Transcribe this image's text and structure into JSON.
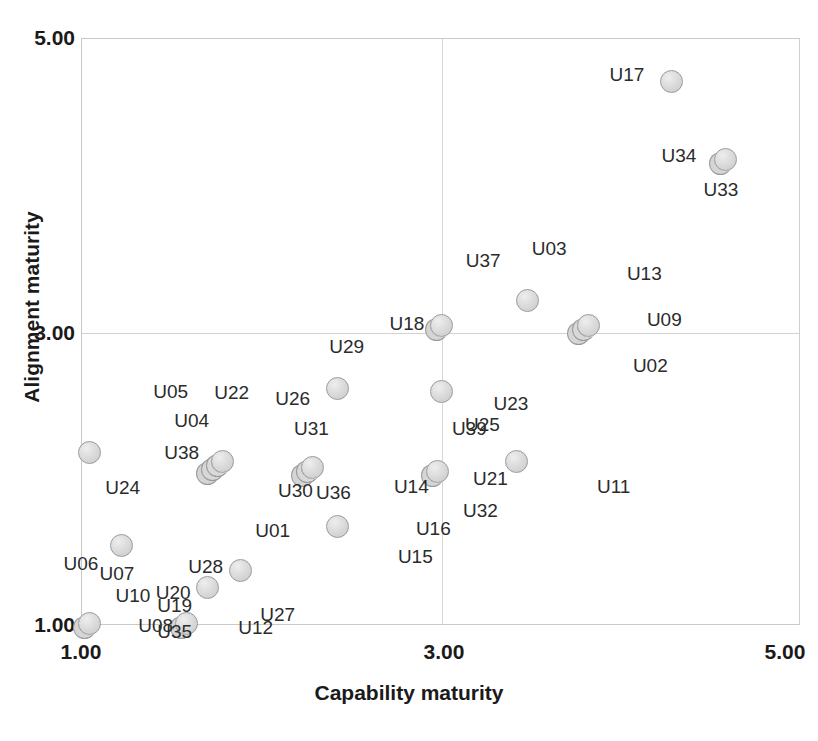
{
  "chart_data": {
    "type": "scatter",
    "title": "",
    "xlabel": "Capability maturity",
    "ylabel": "Alignment maturity",
    "xlim": [
      1.0,
      5.0
    ],
    "ylim": [
      1.0,
      5.0
    ],
    "xticks": [
      "1.00",
      "3.00",
      "5.00"
    ],
    "yticks": [
      "1.00",
      "3.00",
      "5.00"
    ],
    "xtick_values": [
      1.0,
      3.0,
      5.0
    ],
    "ytick_values": [
      1.0,
      3.0,
      5.0
    ],
    "grid": true,
    "gridlines_x": [
      3.0
    ],
    "gridlines_y": [
      3.0
    ],
    "legend": "none",
    "marker_color": "#dcdcdc",
    "marker_edge_color": "#9a9a9a",
    "points": [
      {
        "label": "U17",
        "x": 4.28,
        "y": 4.71,
        "label_dx": -62,
        "label_dy": -8
      },
      {
        "label": "U34",
        "x": 4.58,
        "y": 4.18,
        "label_dx": -64,
        "label_dy": -4
      },
      {
        "label": "U33",
        "x": 4.58,
        "y": 4.18,
        "label_dx": -22,
        "label_dy": 30
      },
      {
        "label": "U37",
        "x": 3.48,
        "y": 3.22,
        "label_dx": -62,
        "label_dy": -40
      },
      {
        "label": "U03",
        "x": 3.48,
        "y": 3.22,
        "label_dx": 4,
        "label_dy": -52
      },
      {
        "label": "U13",
        "x": 3.82,
        "y": 3.05,
        "label_dx": 38,
        "label_dy": -52
      },
      {
        "label": "U09",
        "x": 3.82,
        "y": 3.05,
        "label_dx": 58,
        "label_dy": -6
      },
      {
        "label": "U02",
        "x": 3.82,
        "y": 3.05,
        "label_dx": 44,
        "label_dy": 40
      },
      {
        "label": "U18",
        "x": 3.0,
        "y": 3.05,
        "label_dx": -52,
        "label_dy": -2
      },
      {
        "label": "U29",
        "x": 2.42,
        "y": 2.62,
        "label_dx": -8,
        "label_dy": -42
      },
      {
        "label": "U26",
        "x": 2.42,
        "y": 2.62,
        "label_dx": -62,
        "label_dy": 10
      },
      {
        "label": "U23",
        "x": 3.0,
        "y": 2.6,
        "label_dx": 52,
        "label_dy": 12
      },
      {
        "label": "U05",
        "x": 1.04,
        "y": 2.18,
        "label_dx": 64,
        "label_dy": -62
      },
      {
        "label": "U24",
        "x": 1.04,
        "y": 2.18,
        "label_dx": 16,
        "label_dy": 34
      },
      {
        "label": "U22",
        "x": 1.78,
        "y": 2.12,
        "label_dx": -8,
        "label_dy": -70
      },
      {
        "label": "U04",
        "x": 1.78,
        "y": 2.12,
        "label_dx": -48,
        "label_dy": -42
      },
      {
        "label": "U38",
        "x": 1.78,
        "y": 2.12,
        "label_dx": -58,
        "label_dy": -10
      },
      {
        "label": "U31",
        "x": 2.28,
        "y": 2.08,
        "label_dx": -18,
        "label_dy": -40
      },
      {
        "label": "U30",
        "x": 2.28,
        "y": 2.08,
        "label_dx": -34,
        "label_dy": 22
      },
      {
        "label": "U36",
        "x": 2.28,
        "y": 2.08,
        "label_dx": 4,
        "label_dy": 24
      },
      {
        "label": "U39",
        "x": 2.98,
        "y": 2.05,
        "label_dx": 14,
        "label_dy": -44
      },
      {
        "label": "U14",
        "x": 2.98,
        "y": 2.05,
        "label_dx": -44,
        "label_dy": 14
      },
      {
        "label": "U25",
        "x": 3.42,
        "y": 2.12,
        "label_dx": -52,
        "label_dy": -38
      },
      {
        "label": "U21",
        "x": 3.42,
        "y": 2.12,
        "label_dx": -44,
        "label_dy": 16
      },
      {
        "label": "U11",
        "x": 3.42,
        "y": 2.12,
        "label_dx": 80,
        "label_dy": 24
      },
      {
        "label": "U32",
        "x": 3.42,
        "y": 2.12,
        "label_dx": -54,
        "label_dy": 48
      },
      {
        "label": "U16",
        "x": 2.98,
        "y": 2.05,
        "label_dx": -22,
        "label_dy": 56
      },
      {
        "label": "U15",
        "x": 2.98,
        "y": 2.05,
        "label_dx": -40,
        "label_dy": 84
      },
      {
        "label": "U01",
        "x": 2.42,
        "y": 1.68,
        "label_dx": -82,
        "label_dy": 4
      },
      {
        "label": "U06",
        "x": 1.22,
        "y": 1.55,
        "label_dx": -58,
        "label_dy": 18
      },
      {
        "label": "U07",
        "x": 1.22,
        "y": 1.55,
        "label_dx": -22,
        "label_dy": 28
      },
      {
        "label": "U10",
        "x": 1.22,
        "y": 1.55,
        "label_dx": -6,
        "label_dy": 50
      },
      {
        "label": "U28",
        "x": 1.88,
        "y": 1.38,
        "label_dx": -52,
        "label_dy": -4
      },
      {
        "label": "U20",
        "x": 1.7,
        "y": 1.26,
        "label_dx": -52,
        "label_dy": 4
      },
      {
        "label": "U19",
        "x": 1.04,
        "y": 1.02,
        "label_dx": 68,
        "label_dy": -18
      },
      {
        "label": "U35",
        "x": 1.04,
        "y": 1.02,
        "label_dx": 68,
        "label_dy": 8
      },
      {
        "label": "U08",
        "x": 1.58,
        "y": 1.02,
        "label_dx": -48,
        "label_dy": 2
      },
      {
        "label": "U12",
        "x": 1.58,
        "y": 1.02,
        "label_dx": 52,
        "label_dy": 4
      },
      {
        "label": "U27",
        "x": 1.88,
        "y": 1.38,
        "label_dx": 20,
        "label_dy": 44
      }
    ],
    "markers": [
      {
        "x": 4.28,
        "y": 4.71,
        "stack": 1
      },
      {
        "x": 4.58,
        "y": 4.18,
        "stack": 2
      },
      {
        "x": 3.48,
        "y": 3.22,
        "stack": 1
      },
      {
        "x": 3.82,
        "y": 3.05,
        "stack": 3
      },
      {
        "x": 3.0,
        "y": 3.05,
        "stack": 2
      },
      {
        "x": 2.42,
        "y": 2.62,
        "stack": 1
      },
      {
        "x": 3.0,
        "y": 2.6,
        "stack": 1
      },
      {
        "x": 1.04,
        "y": 2.18,
        "stack": 1
      },
      {
        "x": 1.78,
        "y": 2.12,
        "stack": 4
      },
      {
        "x": 2.28,
        "y": 2.08,
        "stack": 3
      },
      {
        "x": 2.98,
        "y": 2.05,
        "stack": 2
      },
      {
        "x": 3.42,
        "y": 2.12,
        "stack": 1
      },
      {
        "x": 2.42,
        "y": 1.68,
        "stack": 1
      },
      {
        "x": 1.22,
        "y": 1.55,
        "stack": 1
      },
      {
        "x": 1.88,
        "y": 1.38,
        "stack": 1
      },
      {
        "x": 1.7,
        "y": 1.26,
        "stack": 1
      },
      {
        "x": 1.04,
        "y": 1.02,
        "stack": 2
      },
      {
        "x": 1.58,
        "y": 1.02,
        "stack": 2
      }
    ]
  },
  "axes": {
    "x_title": "Capability maturity",
    "y_title": "Alignment maturity",
    "x_tick_labels": [
      "1.00",
      "3.00",
      "5.00"
    ],
    "y_tick_labels": [
      "5.00",
      "3.00",
      "1.00"
    ]
  }
}
